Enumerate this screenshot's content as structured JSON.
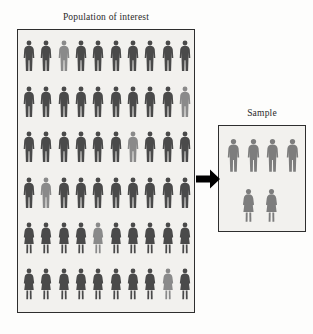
{
  "population": {
    "title": "Population of interest",
    "box_name": "population-of-interest-box",
    "columns": 10,
    "rows": 6,
    "total_figures": 60,
    "colors": {
      "figure_dark": "#4a4a4a",
      "figure_highlight": "#8a8a8a",
      "box_background": "#f2f1ee",
      "box_border": "#2e2e2e"
    },
    "figure_rows": [
      {
        "type": "male",
        "count": 10,
        "highlighted_index": 2
      },
      {
        "type": "male",
        "count": 10,
        "highlighted_index": 9
      },
      {
        "type": "male",
        "count": 10,
        "highlighted_index": 6
      },
      {
        "type": "male",
        "count": 10,
        "highlighted_index": 1
      },
      {
        "type": "female",
        "count": 10,
        "highlighted_index": 4
      },
      {
        "type": "female",
        "count": 10,
        "highlighted_index": 8
      }
    ]
  },
  "sample": {
    "title": "Sample",
    "box_name": "sample-box",
    "total_figures": 6,
    "colors": {
      "figure": "#7d7d7d",
      "box_background": "#f2f1ee",
      "box_border": "#2e2e2e"
    },
    "figure_rows": [
      {
        "type": "male",
        "count": 4,
        "highlighted_index": -1
      },
      {
        "type": "female",
        "count": 2,
        "highlighted_index": -1
      }
    ]
  },
  "arrow": {
    "name": "population-to-sample-arrow",
    "direction": "right",
    "color": "#000000"
  },
  "icons": {
    "male_figure": "male-person-silhouette-icon",
    "female_figure": "female-person-silhouette-icon",
    "arrow": "arrow-right-icon"
  }
}
